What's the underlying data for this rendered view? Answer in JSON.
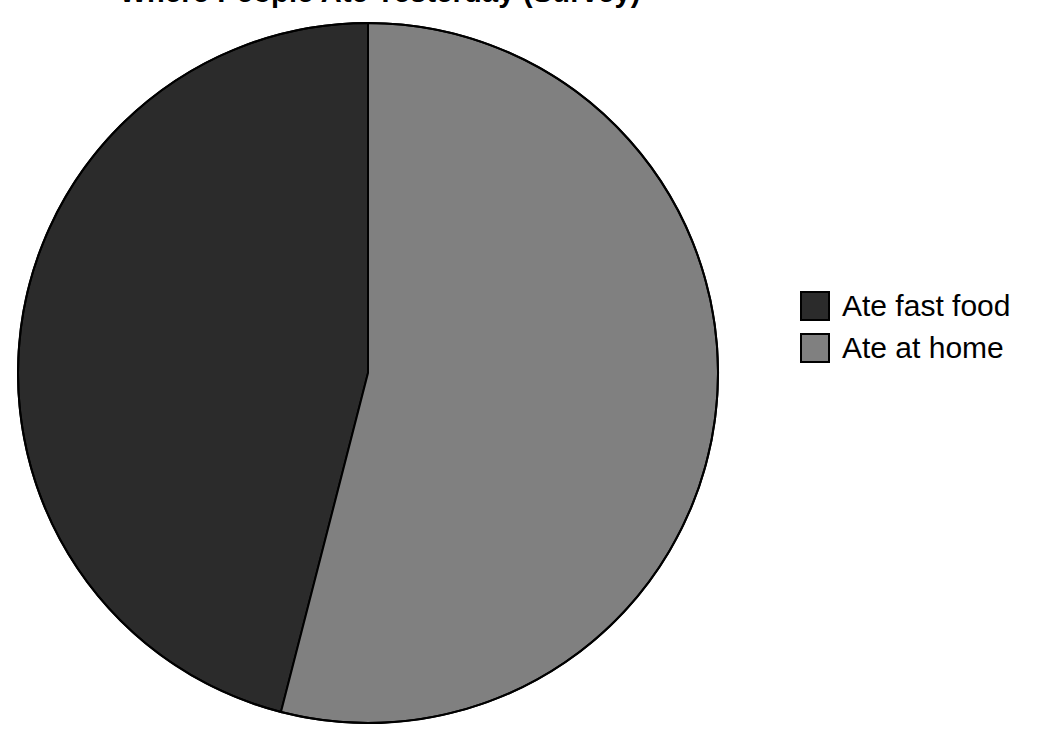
{
  "chart_data": {
    "type": "pie",
    "title": "Where People Ate Yesterday (Survey)",
    "categories": [
      "Ate fast food",
      "Ate at home"
    ],
    "values": [
      46,
      54
    ],
    "value_unit": "percent",
    "colors": [
      "#2b2b2b",
      "#808080"
    ],
    "slice_border_color": "#000000",
    "start_angle_deg": 0,
    "direction": "counterclockwise",
    "legend": {
      "position": "right",
      "entries": [
        {
          "label": "Ate fast food",
          "color": "#2b2b2b"
        },
        {
          "label": "Ate at home",
          "color": "#808080"
        }
      ]
    },
    "xlabel": "",
    "ylabel": "",
    "grid": false,
    "data_labels_shown": false
  },
  "legend": {
    "entries": [
      {
        "label": "Ate fast food"
      },
      {
        "label": "Ate at home"
      }
    ]
  },
  "figure": {
    "background": "#ffffff",
    "pie_center_x": 368,
    "pie_center_y": 373,
    "pie_radius": 350
  }
}
